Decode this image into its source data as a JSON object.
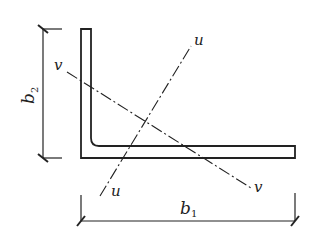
{
  "figure": {
    "type": "angle-section-diagram",
    "colors": {
      "stroke": "#222222",
      "background": "#ffffff"
    }
  },
  "labels": {
    "u_top": "u",
    "u_bottom": "u",
    "v_left": "v",
    "v_right": "v",
    "b1_main": "b",
    "b1_sub": "1",
    "b2_main": "b",
    "b2_sub": "2"
  },
  "dimensions": [
    {
      "name": "b1",
      "orientation": "horizontal",
      "meaning": "horizontal leg width"
    },
    {
      "name": "b2",
      "orientation": "vertical",
      "meaning": "vertical leg height"
    }
  ],
  "axes": [
    {
      "name": "u-u",
      "style": "dash-dot"
    },
    {
      "name": "v-v",
      "style": "dash-dot"
    }
  ]
}
